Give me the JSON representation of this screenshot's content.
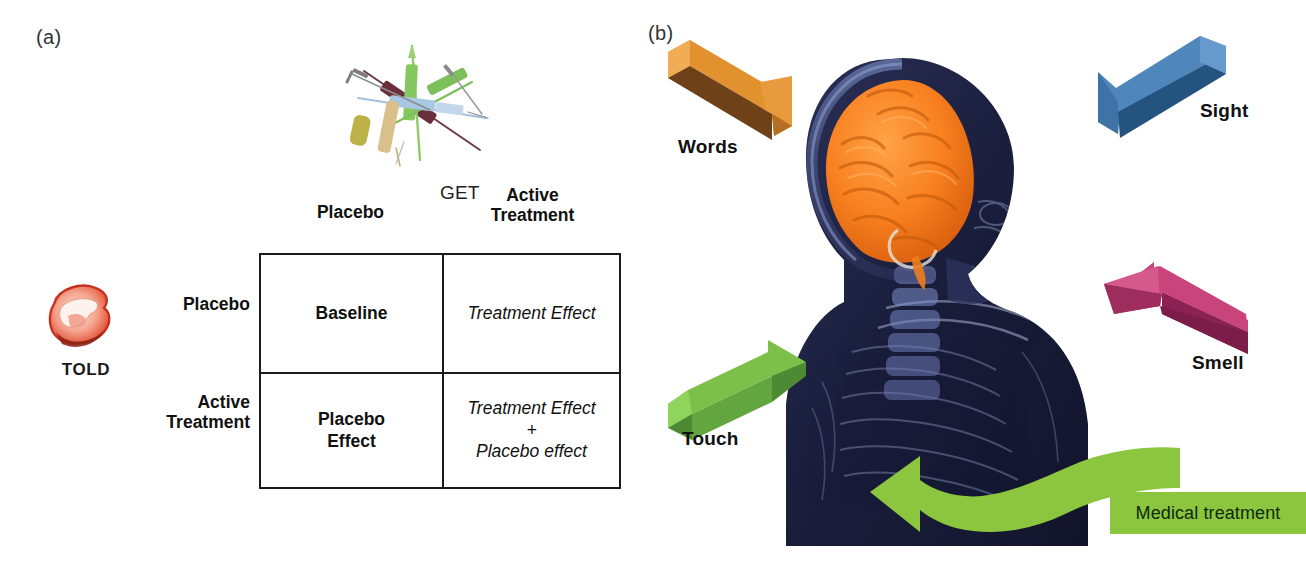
{
  "figure": {
    "panels": [
      {
        "id": "a",
        "label": "(a)"
      },
      {
        "id": "b",
        "label": "(b)"
      }
    ]
  },
  "panel_a": {
    "told_icon_name": "mouth-lips-icon",
    "told_label": "TOLD",
    "get_label": "GET",
    "syringes_icon_name": "syringes-icon",
    "matrix": {
      "column_headers": [
        "Placebo",
        "Active\nTreatment"
      ],
      "column_headers_flat": [
        "Placebo",
        "Active Treatment"
      ],
      "column_header_1": "Placebo",
      "column_header_2_line1": "Active",
      "column_header_2_line2": "Treatment",
      "row_header_1": "Placebo",
      "row_header_2_line1": "Active",
      "row_header_2_line2": "Treatment",
      "cells": {
        "r1c1": "Baseline",
        "r1c2": "Treatment Effect",
        "r2c1_line1": "Placebo",
        "r2c1_line2": "Effect",
        "r2c2_line1": "Treatment Effect",
        "r2c2_line2": "+",
        "r2c2_line3": "Placebo effect"
      }
    }
  },
  "panel_b": {
    "arrows": [
      {
        "name": "words-arrow",
        "label": "Words",
        "color": "#e2912f",
        "shade": "#6f4119",
        "direction": "down-right"
      },
      {
        "name": "sight-arrow",
        "label": "Sight",
        "color": "#4f87bd",
        "shade": "#24537f",
        "direction": "down-left"
      },
      {
        "name": "touch-arrow",
        "label": "Touch",
        "color": "#7cc04a",
        "shade": "#4d8a33",
        "direction": "up-right"
      },
      {
        "name": "smell-arrow",
        "label": "Smell",
        "color": "#c8447a",
        "shade": "#8b2253",
        "direction": "up-left"
      }
    ],
    "medical_treatment_label": "Medical treatment",
    "medical_treatment_color": "#8cc63f",
    "head_illustration_name": "xray-head-brain-illustration",
    "brain_color": "#f4731c",
    "head_color": "#1f2340"
  }
}
